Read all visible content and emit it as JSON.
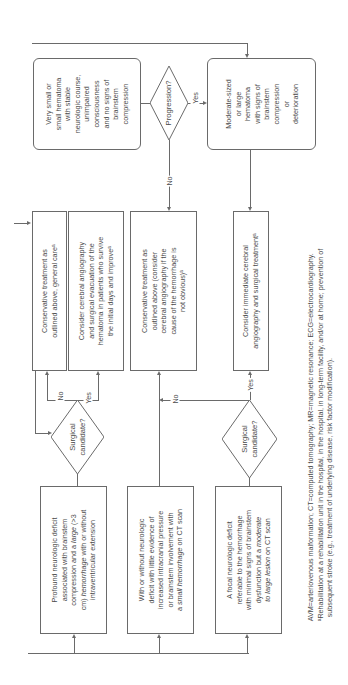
{
  "diagram": {
    "orientation": "rotated-90-ccw",
    "top_row": {
      "very_small_box": [
        "Very small or",
        "small hematoma",
        "with stable",
        "neurologic course,",
        "unimpaired",
        "consciousness",
        "and no signs of",
        "brainstem",
        "compression"
      ],
      "progression_decision": "Progression?",
      "progression_yes": "Yes",
      "progression_no": "No",
      "moderate_box": [
        "Moderate-sized",
        "or large",
        "hematoma",
        "with signs of",
        "brainstem",
        "compression",
        "or",
        "deterioration"
      ]
    },
    "middle_row": {
      "conservative_general": [
        "Conservative treatment as",
        "outlined above, general careᵃ"
      ],
      "consider_angiography_evacuation": [
        "Consider cerebral angiography",
        "and surgical evacuation of the",
        "hematoma in patients who survive",
        "the initial days and improveᵃ"
      ],
      "conservative_consider": [
        "Conservative treatment as",
        "outlined above (consider",
        "cerebral angiography if the",
        "cause of the hemorrhage is",
        "not obvious)ᵃ"
      ],
      "consider_immediate": [
        "Consider immediate cerebral",
        "angiography and surgical treatmentᵃ"
      ]
    },
    "decisions": {
      "left_surgical": [
        "Surgical",
        "candidate?"
      ],
      "left_no": "No",
      "left_yes": "Yes",
      "right_surgical": [
        "Surgical",
        "candidate?"
      ],
      "right_no": "No",
      "right_yes": "Yes"
    },
    "bottom_row": {
      "profound_deficit": {
        "lines": [
          "Profound neurologic deficit",
          "associated with brainstem",
          "compression and a ",
          "large",
          " (>3",
          "cm) ",
          "hemorrhage",
          " with or without",
          "intraventricular extension"
        ]
      },
      "with_or_without": {
        "lines": [
          "With or without neurologic",
          "deficit with little evidence of",
          "increased intracranial pressure",
          "or brainstem involvement with",
          "a ",
          "small hemorrhage",
          " on CT scan"
        ]
      },
      "focal_deficit": {
        "lines": [
          "A focal neurologic deficit",
          "referable to the hemorrhage",
          "with minimal signs of brainstem",
          "dysfunction but a ",
          "moderate",
          "to large lesion",
          " on CT scan"
        ]
      }
    },
    "footnote": {
      "line1": "AVM=arteriovenous malformation; CT=computed tomography; MR=magnetic resonance; ECG=electrocardiography.",
      "line2": "ᵃRehabilitation at a rehabilitation unit in the hospital, in the hospital, in long-term facility, and/or at home; prevention of",
      "line3": "subsequent stroke (e.g., treatment of underlying disease, risk factor modification)."
    }
  }
}
